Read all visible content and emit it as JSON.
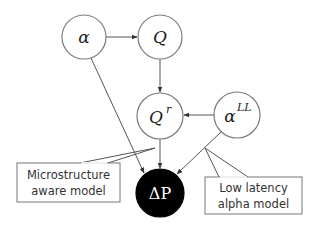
{
  "diagram": {
    "type": "graphical-model",
    "nodes": [
      {
        "id": "alpha",
        "label": "α",
        "sup": "",
        "observed": false,
        "cx": 84,
        "cy": 37,
        "r": 22
      },
      {
        "id": "Q",
        "label": "Q",
        "sup": "",
        "observed": false,
        "cx": 160,
        "cy": 37,
        "r": 22
      },
      {
        "id": "Qr",
        "label": "Q",
        "sup": "r",
        "observed": false,
        "cx": 160,
        "cy": 116,
        "r": 23
      },
      {
        "id": "alphaLL",
        "label": "α",
        "sup": "LL",
        "observed": false,
        "cx": 237,
        "cy": 115,
        "r": 23
      },
      {
        "id": "deltaP",
        "label": "ΔP",
        "sup": "",
        "observed": true,
        "cx": 160,
        "cy": 193,
        "r": 24
      }
    ],
    "edges": [
      {
        "from": "alpha",
        "to": "Q"
      },
      {
        "from": "Q",
        "to": "Qr"
      },
      {
        "from": "alphaLL",
        "to": "Qr"
      },
      {
        "from": "alpha",
        "to": "deltaP"
      },
      {
        "from": "Qr",
        "to": "deltaP"
      },
      {
        "from": "alphaLL",
        "to": "deltaP"
      }
    ],
    "callouts": [
      {
        "id": "microstructure",
        "lines": [
          "Microstructure",
          "aware model"
        ]
      },
      {
        "id": "low-latency",
        "lines": [
          "Low latency",
          "alpha model"
        ]
      }
    ],
    "colors": {
      "node_fill": "#ffffff",
      "node_stroke": "#7a7a7a",
      "observed_fill": "#000000",
      "edge": "#555555"
    }
  }
}
